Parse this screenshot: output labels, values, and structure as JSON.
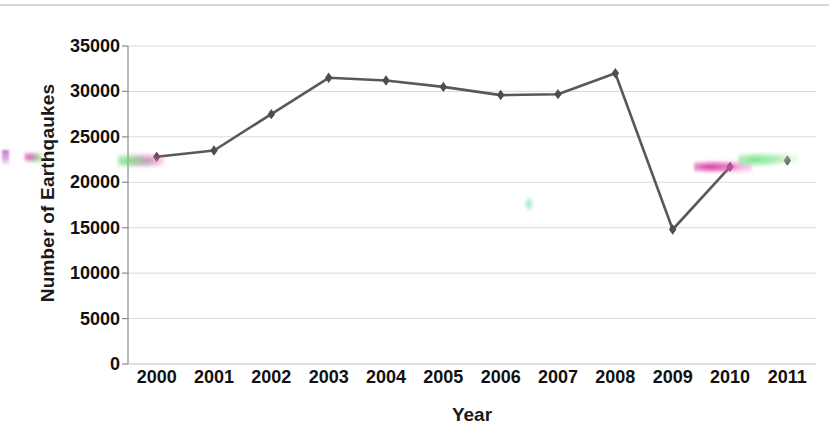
{
  "chart_data": {
    "type": "line",
    "title": "",
    "xlabel": "Year",
    "ylabel": "Number of Earthqaukes",
    "categories": [
      "2000",
      "2001",
      "2002",
      "2003",
      "2004",
      "2005",
      "2006",
      "2007",
      "2008",
      "2009",
      "2010",
      "2011"
    ],
    "values": [
      22800,
      23500,
      27500,
      31500,
      31200,
      30500,
      29600,
      29700,
      32000,
      14800,
      21700,
      22400
    ],
    "series": [
      {
        "name": "Number of Earthqaukes",
        "values": [
          22800,
          23500,
          27500,
          31500,
          31200,
          30500,
          29600,
          29700,
          32000,
          14800,
          21700,
          22400
        ]
      }
    ],
    "ylim": [
      0,
      35000
    ],
    "ytick_labels": [
      "35000",
      "30000",
      "25000",
      "20000",
      "15000",
      "10000",
      "5000",
      "0"
    ],
    "ytick_values": [
      35000,
      30000,
      25000,
      20000,
      15000,
      10000,
      5000,
      0
    ],
    "grid": true,
    "legend": "none",
    "marker": "diamond",
    "line_color": "#595959",
    "marker_color": "#4d4d4d",
    "grid_color": "#d9d9d9",
    "note": "2011 data point is plotted as an isolated marker with no connecting line segment"
  },
  "axes": {
    "y_title": "Number of Earthqaukes",
    "x_title": "Year"
  }
}
